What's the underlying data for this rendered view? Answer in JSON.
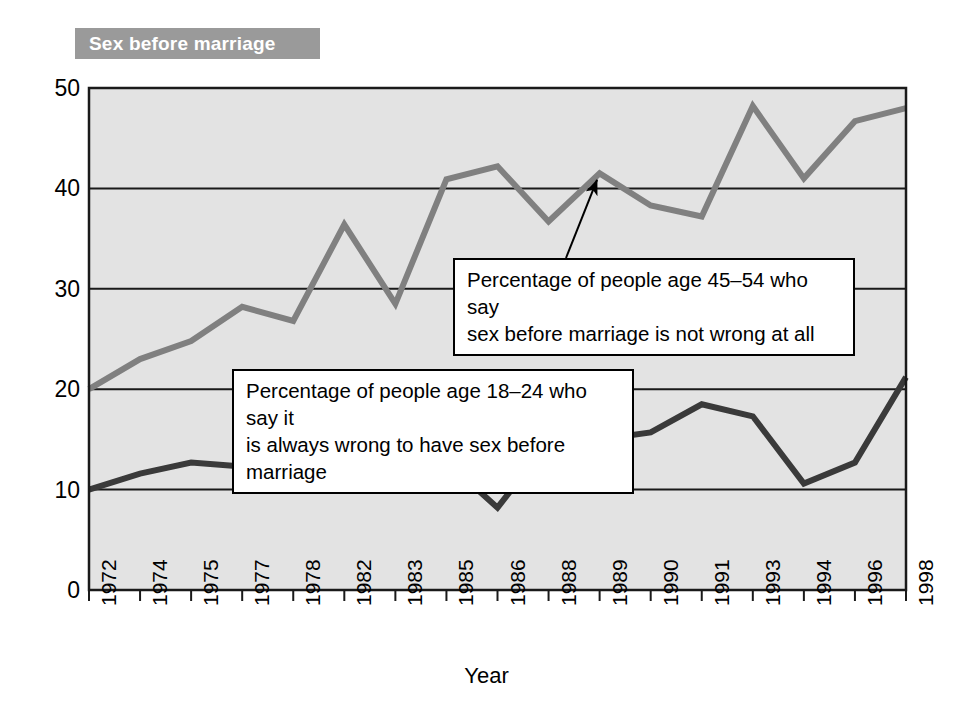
{
  "banner": {
    "title": "Sex before marriage"
  },
  "chart_data": {
    "type": "line",
    "title": "Sex before marriage",
    "xlabel": "Year",
    "ylabel": "",
    "ylim": [
      0,
      50
    ],
    "yticks": [
      "0",
      "10",
      "20",
      "30",
      "40",
      "50"
    ],
    "grid": "horizontal",
    "legend_position": "annotations",
    "categories": [
      "1972",
      "1974",
      "1975",
      "1977",
      "1978",
      "1982",
      "1983",
      "1985",
      "1986",
      "1988",
      "1989",
      "1990",
      "1991",
      "1993",
      "1994",
      "1996",
      "1998"
    ],
    "series": [
      {
        "name": "Percentage of people age 45–54 who say sex before marriage is not wrong at all",
        "color": "#808080",
        "values": [
          20.0,
          23.0,
          24.8,
          28.2,
          26.8,
          36.4,
          28.5,
          40.9,
          42.2,
          36.7,
          41.5,
          38.3,
          37.2,
          48.2,
          41.0,
          46.7,
          48.0
        ]
      },
      {
        "name": "Percentage of people age 18–24 who say it is always wrong to have sex before marriage",
        "color": "#3a3a3a",
        "values": [
          10.0,
          11.6,
          12.7,
          12.3,
          11.9,
          11.3,
          15.2,
          12.8,
          8.2,
          14.7,
          15.0,
          15.7,
          18.5,
          17.3,
          10.6,
          12.7,
          21.2
        ]
      }
    ],
    "annotations": [
      {
        "id": "older",
        "text": "Percentage of people age 45–54 who say\nsex before marriage is not wrong at all",
        "points_to_year": "1989",
        "points_to_value": 41.5
      },
      {
        "id": "younger",
        "text": "Percentage of people age 18–24 who say it\nis always wrong to have sex before marriage",
        "points_to_year": "1982",
        "points_to_value": 11.3
      }
    ]
  },
  "colors": {
    "banner_bg": "#9a9a9a",
    "banner_text": "#ffffff",
    "plot_bg": "#e3e3e3",
    "axis": "#1a1a1a",
    "series_older": "#808080",
    "series_younger": "#3a3a3a"
  }
}
